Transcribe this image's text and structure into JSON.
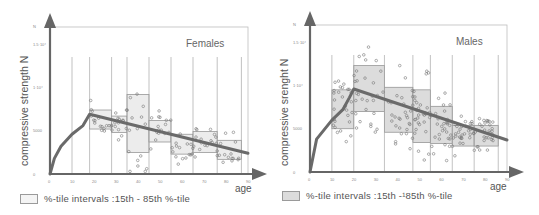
{
  "chart_data": [
    {
      "type": "scatter",
      "title": "Females",
      "xlabel": "age",
      "ylabel": "compressive strength N",
      "xlim": [
        0,
        90
      ],
      "ylim": [
        0,
        20000
      ],
      "x_ticks": [
        "0",
        "10",
        "20",
        "30",
        "40",
        "50",
        "60",
        "70",
        "80",
        "90"
      ],
      "y_ticks": [
        "0",
        "5000",
        "1·10⁴",
        "1.5·10⁴",
        "N"
      ],
      "grid": "vertical lines at age-group boundaries",
      "percentile_boxes": [
        {
          "age_from": 18,
          "age_to": 28,
          "p15": 5200,
          "p85": 7400
        },
        {
          "age_from": 28,
          "age_to": 35,
          "p15": 4800,
          "p85": 6700
        },
        {
          "age_from": 35,
          "age_to": 45,
          "p15": 2500,
          "p85": 9200
        },
        {
          "age_from": 45,
          "age_to": 55,
          "p15": 3700,
          "p85": 6200
        },
        {
          "age_from": 55,
          "age_to": 65,
          "p15": 2300,
          "p85": 4600
        },
        {
          "age_from": 65,
          "age_to": 76,
          "p15": 2500,
          "p85": 4900
        },
        {
          "age_from": 76,
          "age_to": 87,
          "p15": 1700,
          "p85": 3900
        }
      ],
      "trend_line": {
        "rising_curve": [
          [
            0,
            0
          ],
          [
            2,
            1800
          ],
          [
            5,
            3200
          ],
          [
            10,
            4600
          ],
          [
            15,
            5600
          ],
          [
            18,
            6900
          ]
        ],
        "declining_line": [
          [
            18,
            6900
          ],
          [
            90,
            2400
          ]
        ]
      },
      "legend": "%-tile intervals :15th - 85th %-tile",
      "legend_fill": "#ececec"
    },
    {
      "type": "scatter",
      "title": "Males",
      "xlabel": "age",
      "ylabel": "compressive srenght N",
      "xlim": [
        0,
        90
      ],
      "ylim": [
        0,
        20000
      ],
      "x_ticks": [
        "0",
        "10",
        "20",
        "30",
        "40",
        "50",
        "60",
        "70",
        "80",
        "90"
      ],
      "y_ticks": [
        "0",
        "5000",
        "1·10⁴",
        "1.5·10⁴",
        "N"
      ],
      "grid": "vertical lines at age-group boundaries",
      "percentile_boxes": [
        {
          "age_from": 10,
          "age_to": 20,
          "p15": 5000,
          "p85": 9500
        },
        {
          "age_from": 20,
          "age_to": 34,
          "p15": 7000,
          "p85": 12300
        },
        {
          "age_from": 34,
          "age_to": 47,
          "p15": 4600,
          "p85": 9800
        },
        {
          "age_from": 47,
          "age_to": 55,
          "p15": 3400,
          "p85": 9500
        },
        {
          "age_from": 55,
          "age_to": 65,
          "p15": 3300,
          "p85": 7600
        },
        {
          "age_from": 65,
          "age_to": 75,
          "p15": 3000,
          "p85": 5400
        },
        {
          "age_from": 75,
          "age_to": 86,
          "p15": 3000,
          "p85": 5400
        }
      ],
      "trend_line": {
        "rising_curve": [
          [
            0,
            0
          ],
          [
            3,
            3800
          ],
          [
            10,
            6000
          ],
          [
            15,
            7200
          ],
          [
            18,
            8600
          ],
          [
            20,
            9600
          ]
        ],
        "declining_line": [
          [
            20,
            9600
          ],
          [
            90,
            3700
          ]
        ]
      },
      "legend": "%-tile intervals :15th -¹85th %-tile",
      "legend_fill": "#dcdcdc"
    }
  ],
  "females": {
    "title": "Females",
    "ylabel": "compressive strength N",
    "xlabel": "age",
    "legend": "%-tile intervals :15th - 85th %-tile",
    "y_ticks": [
      "0",
      "5000",
      "1·10⁴",
      "1.5·10⁴",
      "N"
    ],
    "x_ticks": [
      "0",
      "10",
      "20",
      "30",
      "40",
      "50",
      "60",
      "70",
      "80",
      "90"
    ]
  },
  "males": {
    "title": "Males",
    "ylabel": "compressive srenght N",
    "xlabel": "age",
    "legend": "%-tile intervals :15th -¹85th %-tile",
    "y_ticks": [
      "0",
      "5000",
      "1·10⁴",
      "1.5·10⁴",
      "N"
    ],
    "x_ticks": [
      "0",
      "10",
      "20",
      "30",
      "40",
      "50",
      "60",
      "70",
      "80",
      "90"
    ]
  }
}
